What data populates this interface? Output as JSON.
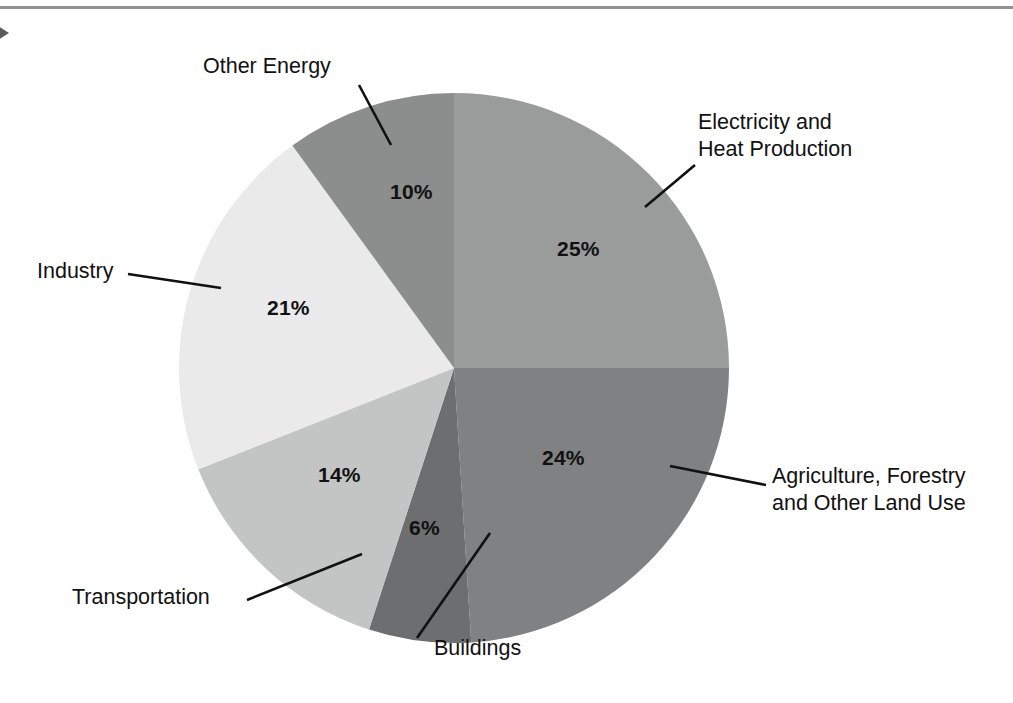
{
  "page": {
    "marker_icon": "right-triangle-marker-icon",
    "rule_color": "#8f9295",
    "background": "#ffffff"
  },
  "chart_data": {
    "type": "pie",
    "title": "",
    "subtitle": "",
    "xlabel": "",
    "ylabel": "",
    "legend_position": "callout-labels",
    "grid": false,
    "total": 100,
    "unit": "%",
    "start_angle_deg": 0,
    "direction": "clockwise",
    "categories": [
      "Electricity and Heat Production",
      "Agriculture, Forestry and Other Land Use",
      "Buildings",
      "Transportation",
      "Industry",
      "Other Energy"
    ],
    "values": [
      25,
      24,
      6,
      14,
      21,
      10
    ],
    "colors": [
      "#9a9b9b",
      "#808182",
      "#6d6e6f",
      "#c3c4c4",
      "#eaeaea",
      "#8c8d8d"
    ],
    "slices": [
      {
        "label_line1": "Electricity and",
        "label_line2": "Heat Production",
        "label_full": "Electricity and Heat Production",
        "value": 25,
        "value_text": "25%",
        "color": "#9a9b9b"
      },
      {
        "label_line1": "Agriculture, Forestry",
        "label_line2": "and Other Land Use",
        "label_full": "Agriculture, Forestry and Other Land Use",
        "value": 24,
        "value_text": "24%",
        "color": "#808182"
      },
      {
        "label_line1": "Buildings",
        "label_line2": "",
        "label_full": "Buildings",
        "value": 6,
        "value_text": "6%",
        "color": "#6d6e6f"
      },
      {
        "label_line1": "Transportation",
        "label_line2": "",
        "label_full": "Transportation",
        "value": 14,
        "value_text": "14%",
        "color": "#c3c4c4"
      },
      {
        "label_line1": "Industry",
        "label_line2": "",
        "label_full": "Industry",
        "value": 21,
        "value_text": "21%",
        "color": "#eaeaea"
      },
      {
        "label_line1": "Other Energy",
        "label_line2": "",
        "label_full": "Other Energy",
        "value": 10,
        "value_text": "10%",
        "color": "#8c8d8d"
      }
    ]
  }
}
